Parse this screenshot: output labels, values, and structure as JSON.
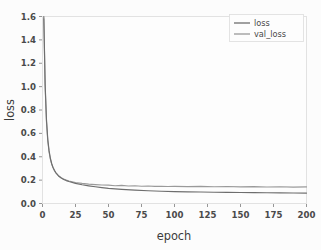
{
  "chart_data": {
    "type": "line",
    "title": "",
    "xlabel": "epoch",
    "ylabel": "loss",
    "xlim": [
      0,
      200
    ],
    "ylim": [
      0.0,
      1.6
    ],
    "grid": false,
    "legend_position": "top-right",
    "xticks": [
      "0",
      "25",
      "50",
      "75",
      "100",
      "125",
      "150",
      "175",
      "200"
    ],
    "xtick_values": [
      0,
      25,
      50,
      75,
      100,
      125,
      150,
      175,
      200
    ],
    "yticks": [
      "0.0",
      "0.2",
      "0.4",
      "0.6",
      "0.8",
      "1.0",
      "1.2",
      "1.4",
      "1.6"
    ],
    "ytick_values": [
      0.0,
      0.2,
      0.4,
      0.6,
      0.8,
      1.0,
      1.2,
      1.4,
      1.6
    ],
    "colors": {
      "loss": "#6e6e6e",
      "val_loss": "#9a9a9a",
      "frame": "#e2e2e2",
      "text": "#4a4a4a",
      "background": "#fdfdfd"
    },
    "series": [
      {
        "name": "loss",
        "x": [
          1,
          2,
          3,
          4,
          5,
          6,
          7,
          8,
          9,
          10,
          12,
          14,
          16,
          18,
          20,
          25,
          30,
          35,
          40,
          45,
          50,
          60,
          70,
          80,
          90,
          100,
          110,
          120,
          130,
          140,
          150,
          160,
          170,
          180,
          190,
          200
        ],
        "values": [
          1.6,
          1.02,
          0.72,
          0.55,
          0.45,
          0.385,
          0.34,
          0.308,
          0.284,
          0.265,
          0.238,
          0.22,
          0.206,
          0.196,
          0.188,
          0.172,
          0.16,
          0.151,
          0.143,
          0.136,
          0.13,
          0.121,
          0.114,
          0.109,
          0.105,
          0.102,
          0.1,
          0.098,
          0.096,
          0.095,
          0.094,
          0.093,
          0.092,
          0.091,
          0.09,
          0.089
        ]
      },
      {
        "name": "val_loss",
        "x": [
          1,
          2,
          3,
          4,
          5,
          6,
          7,
          8,
          9,
          10,
          12,
          14,
          16,
          18,
          20,
          25,
          30,
          35,
          40,
          45,
          50,
          55,
          60,
          65,
          70,
          75,
          80,
          85,
          90,
          95,
          100,
          110,
          120,
          130,
          140,
          150,
          160,
          170,
          180,
          190,
          200
        ],
        "values": [
          1.58,
          1.0,
          0.7,
          0.535,
          0.44,
          0.378,
          0.335,
          0.305,
          0.282,
          0.264,
          0.238,
          0.221,
          0.209,
          0.2,
          0.193,
          0.18,
          0.172,
          0.166,
          0.162,
          0.158,
          0.157,
          0.152,
          0.155,
          0.15,
          0.152,
          0.148,
          0.15,
          0.146,
          0.148,
          0.145,
          0.147,
          0.144,
          0.146,
          0.143,
          0.145,
          0.142,
          0.144,
          0.141,
          0.143,
          0.14,
          0.142
        ]
      }
    ]
  },
  "legend": {
    "entries": [
      {
        "label": "loss"
      },
      {
        "label": "val_loss"
      }
    ]
  }
}
